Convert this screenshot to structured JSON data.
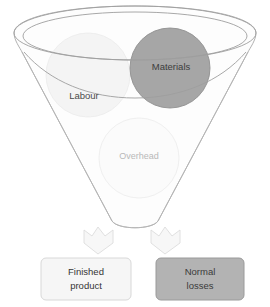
{
  "diagram": {
    "type": "funnel-flow-diagram",
    "funnel": {
      "name": "process-funnel",
      "rim_style": "double-ellipse",
      "fill": "#fdfdfd",
      "stroke": "#a8a8a8"
    },
    "inputs": [
      {
        "id": "labour",
        "label": "Labour",
        "shape": "circle",
        "fill": "#f4f4f4",
        "stroke": "#ececec",
        "text_color": "#4a4a4a"
      },
      {
        "id": "materials",
        "label": "Materials",
        "shape": "circle",
        "fill": "#a6a6a6",
        "stroke": "#8f8f8f",
        "text_color": "#3d3d3d"
      },
      {
        "id": "overhead",
        "label": "Overhead",
        "shape": "circle",
        "fill": "#fbfbfb",
        "stroke": "#ededed",
        "text_color": "#b9b9b9"
      }
    ],
    "arrows": [
      {
        "id": "arrow-left",
        "direction": "down",
        "fill": "#f7f7f7",
        "stroke": "#dcdcdc"
      },
      {
        "id": "arrow-right",
        "direction": "down",
        "fill": "#f7f7f7",
        "stroke": "#dcdcdc"
      }
    ],
    "outputs": [
      {
        "id": "finished-product",
        "line1": "Finished",
        "line2": "product",
        "fill": "#f6f6f6",
        "stroke": "#d8d8d8",
        "text_color": "#353535"
      },
      {
        "id": "normal-losses",
        "line1": "Normal",
        "line2": "losses",
        "fill": "#b3b3b3",
        "stroke": "#9a9a9a",
        "text_color": "#3a3a3a"
      }
    ]
  },
  "colors": {
    "background": "#ffffff",
    "outline": "#a8a8a8",
    "dark_gray": "#a6a6a6",
    "mid_gray": "#b3b3b3",
    "light_gray": "#f4f4f4"
  }
}
